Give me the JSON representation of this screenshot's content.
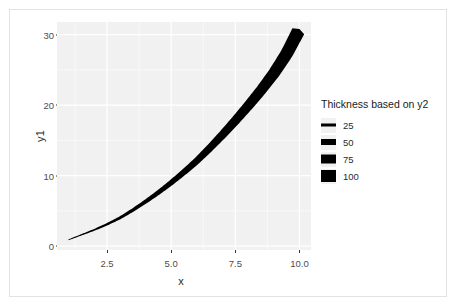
{
  "chart_data": {
    "type": "line",
    "title": "",
    "xlabel": "x",
    "ylabel": "y1",
    "xlim": [
      0.55,
      10.45
    ],
    "ylim": [
      -0.55,
      31.8
    ],
    "xticks": [
      "2.5",
      "5.0",
      "7.5",
      "10.0"
    ],
    "xtick_values": [
      2.5,
      5.0,
      7.5,
      10.0
    ],
    "yticks": [
      "0",
      "10",
      "20",
      "30"
    ],
    "ytick_values": [
      0,
      10,
      20,
      30
    ],
    "grid": true,
    "grid_color": "#ffffff",
    "panel_color": "#f1f1f1",
    "line_color": "#000000",
    "x": [
      1,
      1.5,
      2,
      2.5,
      3,
      3.5,
      4,
      4.5,
      5,
      5.5,
      6,
      6.5,
      7,
      7.5,
      8,
      8.5,
      9,
      9.5,
      10
    ],
    "y1": [
      0.9,
      1.6,
      2.3,
      3.1,
      4.0,
      5.1,
      6.3,
      7.6,
      9.0,
      10.5,
      12.1,
      13.9,
      15.8,
      17.8,
      19.9,
      22.1,
      24.5,
      27.3,
      30.8
    ],
    "y2": [
      25,
      29.2,
      33.3,
      37.5,
      41.7,
      45.8,
      50,
      54.2,
      58.3,
      62.5,
      66.7,
      70.8,
      75,
      79.2,
      83.3,
      87.5,
      91.7,
      95.8,
      100
    ],
    "thickness_px": [
      0.9,
      1.3,
      1.8,
      2.3,
      2.8,
      3.4,
      4.0,
      4.6,
      5.3,
      6.0,
      6.7,
      7.4,
      8.2,
      9.0,
      9.8,
      10.6,
      11.5,
      12.4,
      13.3
    ],
    "legend": {
      "title": "Thickness based on y2",
      "position": "right",
      "entries": [
        {
          "label": "25",
          "value": 25,
          "key_thickness_px": 3
        },
        {
          "label": "50",
          "value": 50,
          "key_thickness_px": 6
        },
        {
          "label": "75",
          "value": 75,
          "key_thickness_px": 9
        },
        {
          "label": "100",
          "value": 100,
          "key_thickness_px": 12
        }
      ]
    }
  }
}
